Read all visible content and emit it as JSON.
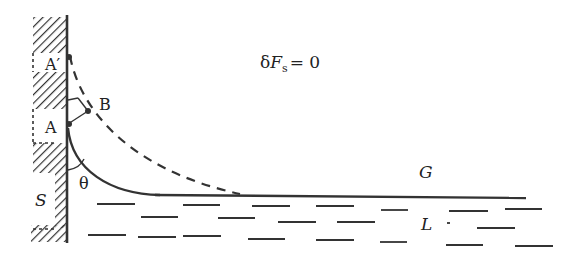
{
  "diagram": {
    "type": "contact-angle-meniscus",
    "equation": {
      "prefix": "δ",
      "var": "F",
      "sub": "s",
      "rhs": "= 0"
    },
    "labels": {
      "point_a_prime": "A′",
      "point_a": "A",
      "point_b": "B",
      "angle": "θ",
      "solid": "S",
      "gas": "G",
      "liquid": "L"
    },
    "colors": {
      "ink": "#333333",
      "background": "#ffffff"
    },
    "elements": {
      "wall": "vertical solid wall with diagonal hatching",
      "solid_curve": "meniscus profile from A meeting liquid surface",
      "dashed_curve": "displaced meniscus profile from A′ through B",
      "liquid_surface": "horizontal line",
      "liquid_dashes": "horizontal dash marks indicating liquid"
    }
  }
}
